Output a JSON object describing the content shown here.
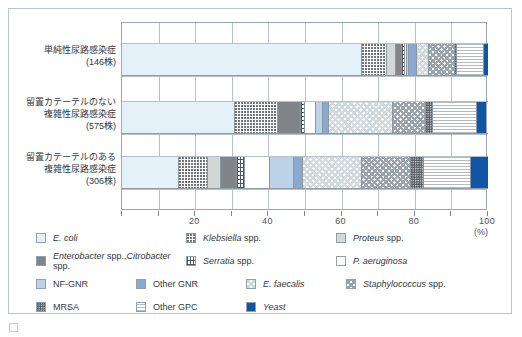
{
  "chart_data": {
    "type": "bar",
    "orientation": "horizontal",
    "stacked": true,
    "normalized_percent": true,
    "title": "",
    "xlabel": "(%)",
    "ylabel": "",
    "xlim": [
      0,
      100
    ],
    "xticks": [
      0,
      10,
      20,
      30,
      40,
      50,
      60,
      70,
      80,
      90,
      100
    ],
    "xtick_labels": [
      "",
      "",
      "20",
      "",
      "40",
      "",
      "60",
      "",
      "80",
      "",
      "100"
    ],
    "grid": "vertical",
    "legend_position": "bottom",
    "categories": [
      "単純性尿路感染症\n(146株)",
      "留置カテーテルのない\n複雑性尿路感染症\n(575株)",
      "留置カテーテルのある\n複雑性尿路感染症\n(306株)"
    ],
    "series": [
      {
        "name": "E. coli",
        "italic": "E. coli",
        "plain": "",
        "key": "ecoli",
        "values": [
          65.5,
          31.0,
          15.5
        ]
      },
      {
        "name": "Klebsiella spp.",
        "italic": "Klebsiella",
        "plain": " spp.",
        "key": "klebsiella",
        "values": [
          7.0,
          11.5,
          8.0
        ]
      },
      {
        "name": "Proteus spp.",
        "italic": "Proteus",
        "plain": " spp.",
        "key": "proteus",
        "values": [
          2.5,
          0.0,
          3.5
        ]
      },
      {
        "name": "Enterobacter spp., Citrobacter spp.",
        "italic": "Enterobacter",
        "plain": " spp.,",
        "italic2": "Citrobacter",
        "plain2": " spp.",
        "key": "enterobacter",
        "values": [
          1.5,
          6.5,
          4.5
        ]
      },
      {
        "name": "Serratia spp.",
        "italic": "Serratia",
        "plain": " spp.",
        "key": "serratia",
        "values": [
          0.7,
          1.0,
          2.0
        ]
      },
      {
        "name": "P. aeruginosa",
        "italic": "P. aeruginosa",
        "plain": "",
        "key": "paeruginosa",
        "values": [
          0.8,
          3.0,
          7.0
        ]
      },
      {
        "name": "NF-GNR",
        "italic": "",
        "plain": "NF-GNR",
        "key": "nfgnr",
        "values": [
          0.5,
          2.0,
          6.5
        ]
      },
      {
        "name": "Other GNR",
        "italic": "",
        "plain": "Other GNR",
        "key": "othergnr",
        "values": [
          2.0,
          1.5,
          2.5
        ]
      },
      {
        "name": "E. faecalis",
        "italic": "E. faecalis",
        "plain": "",
        "key": "efaecalis",
        "values": [
          3.5,
          17.5,
          16.0
        ]
      },
      {
        "name": "Staphylococcus spp.",
        "italic": "Staphylococcus",
        "plain": " spp.",
        "key": "staph",
        "values": [
          7.0,
          9.0,
          13.5
        ]
      },
      {
        "name": "MRSA",
        "italic": "",
        "plain": "MRSA",
        "key": "mrsa",
        "values": [
          0.5,
          2.0,
          3.5
        ]
      },
      {
        "name": "Other GPC",
        "italic": "",
        "plain": "Other GPC",
        "key": "othergpc",
        "values": [
          7.5,
          12.0,
          13.0
        ]
      },
      {
        "name": "Yeast",
        "italic": "Yeast",
        "plain": "",
        "key": "yeast",
        "values": [
          1.0,
          2.5,
          4.5
        ]
      }
    ]
  },
  "axis": {
    "labels": [
      {
        "value": "20",
        "pct": 20
      },
      {
        "value": "40",
        "pct": 40
      },
      {
        "value": "60",
        "pct": 60
      },
      {
        "value": "80",
        "pct": 80
      },
      {
        "value": "100",
        "pct": 100
      }
    ],
    "unit": "(%)"
  },
  "categories": [
    {
      "line1": "単純性尿路感染症",
      "line2": "(146株)",
      "line3": "",
      "text": "単純性尿路感染症\n(146株)"
    },
    {
      "line1": "留置カテーテルのない",
      "line2": "複雑性尿路感染症",
      "line3": "(575株)",
      "text": "留置カテーテルのない\n複雑性尿路感染症\n(575株)"
    },
    {
      "line1": "留置カテーテルのある",
      "line2": "複雑性尿路感染症",
      "line3": "(306株)",
      "text": "留置カテーテルのある\n複雑性尿路感染症\n(306株)"
    }
  ],
  "legend": {
    "rows": [
      [
        {
          "key": "ecoli",
          "italic": "E. coli",
          "plain": ""
        },
        {
          "key": "klebsiella",
          "italic": "Klebsiella",
          "plain": " spp."
        },
        {
          "key": "proteus",
          "italic": "Proteus",
          "plain": " spp."
        }
      ],
      [
        {
          "key": "enterobacter",
          "italic": "Enterobacter",
          "plain": " spp.,",
          "italic2": "Citrobacter",
          "plain2": " spp."
        },
        {
          "key": "serratia",
          "italic": "Serratia",
          "plain": " spp."
        },
        {
          "key": "paeruginosa",
          "italic": "P. aeruginosa",
          "plain": ""
        }
      ],
      [
        {
          "key": "nfgnr",
          "italic": "",
          "plain": "NF-GNR"
        },
        {
          "key": "othergnr",
          "italic": "",
          "plain": "Other GNR"
        },
        {
          "key": "efaecalis",
          "italic": "E. faecalis",
          "plain": ""
        },
        {
          "key": "staph",
          "italic": "Staphylococcus",
          "plain": " spp."
        }
      ],
      [
        {
          "key": "mrsa",
          "italic": "",
          "plain": "MRSA"
        },
        {
          "key": "othergpc",
          "italic": "",
          "plain": "Other GPC"
        },
        {
          "key": "yeast",
          "italic": "Yeast",
          "plain": ""
        }
      ]
    ]
  },
  "colors": {
    "ecoli": "#e4f1f8",
    "proteus": "#d2d6d7",
    "enterobacter": "#818589",
    "nfgnr": "#bcd2e6",
    "othergnr": "#8aa9d1",
    "yeast": "#1156a6",
    "grid": "#b6c2cb",
    "frame": "#b9c4cc",
    "text": "#33383c"
  }
}
